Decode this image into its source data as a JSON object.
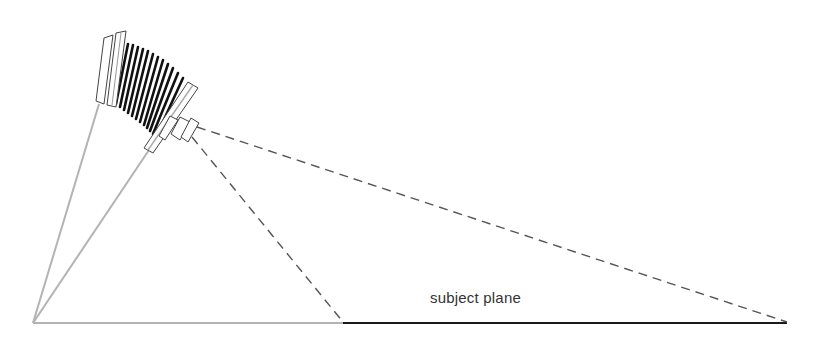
{
  "diagram": {
    "type": "camera-scheimpflug-illustration",
    "labels": {
      "subject_plane": "subject plane"
    },
    "elements": {
      "camera": "view camera with bellows, tilted",
      "film_plane_line": "gray line from camera back to origin",
      "lens_plane_line": "gray line from front standard to origin",
      "ground_line": "gray baseline from origin to subject plane start",
      "subject_plane": "solid black line",
      "field_of_view": "two dashed lines from lens to ends of subject plane"
    },
    "colors": {
      "construction_line": "#b3b3b3",
      "subject_line": "#1a1a1a",
      "dashed_line": "#555555",
      "camera_outline": "#444444",
      "bellows": "#111111"
    }
  }
}
